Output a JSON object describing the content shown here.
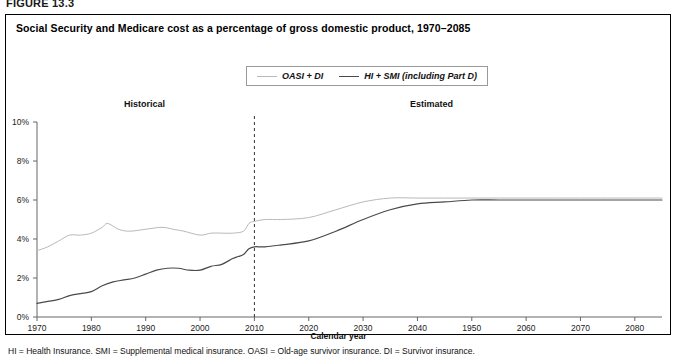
{
  "figure_label": "FIGURE 13.3",
  "chart_title": "Social Security and Medicare cost as a percentage of gross domestic product, 1970–2085",
  "annotations": {
    "historical": "Historical",
    "estimated": "Estimated"
  },
  "footnote": "HI = Health Insurance. SMI = Supplemental medical insurance. OASI = Old-age survivor insurance. DI = Survivor insurance.",
  "colors": {
    "series_oasi_di": "#b9b9b9",
    "series_hi_smi": "#4a4a4a",
    "axis": "#666666",
    "divider": "#333333",
    "panel_border": "#000000"
  },
  "chart_data": {
    "type": "line",
    "title": "Social Security and Medicare cost as a percentage of gross domestic product, 1970–2085",
    "xlabel": "Calendar year",
    "ylabel": "",
    "xlim": [
      1970,
      2085
    ],
    "ylim": [
      0,
      10
    ],
    "grid": false,
    "legend_position": "top-center",
    "xticks": [
      1970,
      1980,
      1990,
      2000,
      2010,
      2020,
      2030,
      2040,
      1950,
      2060,
      2070,
      2080
    ],
    "xtick_years": [
      1970,
      1980,
      1990,
      2000,
      2010,
      2020,
      2030,
      2040,
      2050,
      2060,
      2070,
      2080
    ],
    "yticks": [
      0,
      2,
      4,
      6,
      8,
      10
    ],
    "ytick_labels": [
      "0%",
      "2%",
      "4%",
      "6%",
      "8%",
      "10%"
    ],
    "divider_year": 2010,
    "divider_style": "dashed",
    "series": [
      {
        "name": "OASI + DI",
        "color": "#b9b9b9",
        "x": [
          1970,
          1972,
          1974,
          1976,
          1978,
          1980,
          1982,
          1983,
          1985,
          1987,
          1990,
          1993,
          1995,
          1997,
          2000,
          2002,
          2004,
          2006,
          2008,
          2009,
          2010,
          2012,
          2015,
          2020,
          2025,
          2030,
          2035,
          2040,
          2045,
          2050,
          2055,
          2060,
          2065,
          2070,
          2075,
          2080,
          2085
        ],
        "values": [
          3.4,
          3.6,
          3.9,
          4.2,
          4.2,
          4.3,
          4.6,
          4.8,
          4.5,
          4.4,
          4.5,
          4.6,
          4.5,
          4.4,
          4.2,
          4.3,
          4.3,
          4.3,
          4.4,
          4.8,
          4.9,
          5.0,
          5.0,
          5.1,
          5.5,
          5.9,
          6.1,
          6.1,
          6.1,
          6.1,
          6.1,
          6.1,
          6.1,
          6.1,
          6.1,
          6.1,
          6.1
        ]
      },
      {
        "name": "HI + SMI (including Part D)",
        "color": "#4a4a4a",
        "x": [
          1970,
          1972,
          1974,
          1976,
          1978,
          1980,
          1982,
          1984,
          1986,
          1988,
          1990,
          1992,
          1994,
          1996,
          1998,
          2000,
          2002,
          2004,
          2006,
          2007,
          2008,
          2009,
          2010,
          2012,
          2015,
          2020,
          2025,
          2030,
          2035,
          2040,
          2045,
          2050,
          2055,
          2060,
          2065,
          2070,
          2075,
          2080,
          2085
        ],
        "values": [
          0.7,
          0.8,
          0.9,
          1.1,
          1.2,
          1.3,
          1.6,
          1.8,
          1.9,
          2.0,
          2.2,
          2.4,
          2.5,
          2.5,
          2.4,
          2.4,
          2.6,
          2.7,
          3.0,
          3.1,
          3.2,
          3.5,
          3.6,
          3.6,
          3.7,
          3.9,
          4.4,
          5.0,
          5.5,
          5.8,
          5.9,
          6.0,
          6.0,
          6.0,
          6.0,
          6.0,
          6.0,
          6.0,
          6.0
        ]
      }
    ]
  }
}
